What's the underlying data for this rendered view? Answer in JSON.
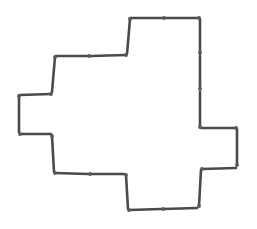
{
  "diagram": {
    "type": "matchstick-shape",
    "stick_color": "#4a4a4a",
    "head_color": "#5a5a5a",
    "background": "#ffffff",
    "stick_count": 24,
    "sticks": [
      {
        "x1": 130,
        "y1": 18,
        "x2": 164,
        "y2": 18
      },
      {
        "x1": 165,
        "y1": 18,
        "x2": 199,
        "y2": 18
      },
      {
        "x1": 200,
        "y1": 19,
        "x2": 200,
        "y2": 53
      },
      {
        "x1": 200,
        "y1": 56,
        "x2": 200,
        "y2": 89
      },
      {
        "x1": 200,
        "y1": 92,
        "x2": 200,
        "y2": 127
      },
      {
        "x1": 201,
        "y1": 128,
        "x2": 236,
        "y2": 128
      },
      {
        "x1": 237,
        "y1": 129,
        "x2": 237,
        "y2": 165
      },
      {
        "x1": 236,
        "y1": 168,
        "x2": 202,
        "y2": 169
      },
      {
        "x1": 201,
        "y1": 170,
        "x2": 199,
        "y2": 206
      },
      {
        "x1": 197,
        "y1": 208,
        "x2": 163,
        "y2": 209
      },
      {
        "x1": 161,
        "y1": 209,
        "x2": 129,
        "y2": 210
      },
      {
        "x1": 128,
        "y1": 209,
        "x2": 126,
        "y2": 175
      },
      {
        "x1": 124,
        "y1": 174,
        "x2": 90,
        "y2": 174
      },
      {
        "x1": 88,
        "y1": 174,
        "x2": 55,
        "y2": 173
      },
      {
        "x1": 54,
        "y1": 172,
        "x2": 52,
        "y2": 136
      },
      {
        "x1": 51,
        "y1": 134,
        "x2": 20,
        "y2": 134
      },
      {
        "x1": 19,
        "y1": 132,
        "x2": 19,
        "y2": 96
      },
      {
        "x1": 20,
        "y1": 95,
        "x2": 51,
        "y2": 94
      },
      {
        "x1": 52,
        "y1": 92,
        "x2": 55,
        "y2": 57
      },
      {
        "x1": 56,
        "y1": 56,
        "x2": 89,
        "y2": 56
      },
      {
        "x1": 91,
        "y1": 56,
        "x2": 126,
        "y2": 55
      },
      {
        "x1": 127,
        "y1": 54,
        "x2": 130,
        "y2": 19
      }
    ],
    "heads": [
      [
        164,
        18
      ],
      [
        199,
        18
      ],
      [
        200,
        53
      ],
      [
        200,
        89
      ],
      [
        200,
        127
      ],
      [
        236,
        128
      ],
      [
        237,
        165
      ],
      [
        202,
        169
      ],
      [
        199,
        206
      ],
      [
        163,
        209
      ],
      [
        129,
        210
      ],
      [
        126,
        175
      ],
      [
        90,
        174
      ],
      [
        55,
        173
      ],
      [
        52,
        136
      ],
      [
        20,
        134
      ],
      [
        19,
        96
      ],
      [
        51,
        94
      ],
      [
        55,
        57
      ],
      [
        89,
        56
      ],
      [
        126,
        55
      ],
      [
        130,
        19
      ]
    ]
  }
}
